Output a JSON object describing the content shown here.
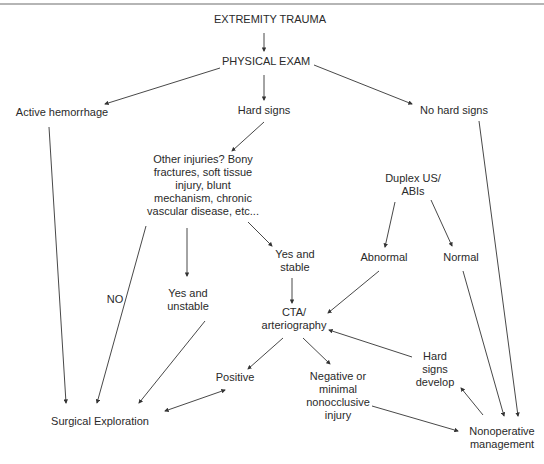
{
  "diagram": {
    "type": "flowchart",
    "nodes": {
      "extremity_trauma": "EXTREMITY TRAUMA",
      "physical_exam": "PHYSICAL EXAM",
      "active_hemorrhage": "Active hemorrhage",
      "hard_signs": "Hard signs",
      "no_hard_signs": "No hard signs",
      "other_injuries": [
        "Other injuries? Bony",
        "fractures, soft tissue",
        "injury, blunt",
        "mechanism, chronic",
        "vascular disease, etc..."
      ],
      "duplex": [
        "Duplex US/",
        "ABIs"
      ],
      "abnormal": "Abnormal",
      "normal": "Normal",
      "no": "NO",
      "yes_unstable": [
        "Yes and",
        "unstable"
      ],
      "yes_stable": [
        "Yes and",
        "stable"
      ],
      "cta": [
        "CTA/",
        "arteriography"
      ],
      "hard_signs_develop": [
        "Hard",
        "signs",
        "develop"
      ],
      "positive": "Positive",
      "negative": [
        "Negative or",
        "minimal",
        "nonocclusive",
        "injury"
      ],
      "surgical_exploration": "Surgical Exploration",
      "nonoperative": [
        "Nonoperative",
        "management"
      ]
    },
    "edges": [
      [
        "EXTREMITY TRAUMA",
        "PHYSICAL EXAM"
      ],
      [
        "PHYSICAL EXAM",
        "Active hemorrhage"
      ],
      [
        "PHYSICAL EXAM",
        "Hard signs"
      ],
      [
        "PHYSICAL EXAM",
        "No hard signs"
      ],
      [
        "Hard signs",
        "Other injuries"
      ],
      [
        "Active hemorrhage",
        "Surgical Exploration"
      ],
      [
        "Other injuries (NO)",
        "Surgical Exploration"
      ],
      [
        "Other injuries",
        "Yes and unstable"
      ],
      [
        "Other injuries",
        "Yes and stable"
      ],
      [
        "Yes and unstable",
        "Surgical Exploration"
      ],
      [
        "Yes and stable",
        "CTA/arteriography"
      ],
      [
        "Duplex US/ABIs",
        "Abnormal"
      ],
      [
        "Duplex US/ABIs",
        "Normal"
      ],
      [
        "Abnormal",
        "CTA/arteriography"
      ],
      [
        "Normal",
        "Nonoperative management"
      ],
      [
        "No hard signs",
        "Nonoperative management"
      ],
      [
        "CTA/arteriography",
        "Positive"
      ],
      [
        "CTA/arteriography",
        "Negative or minimal nonocclusive injury"
      ],
      [
        "Positive",
        "Surgical Exploration (bidirectional)"
      ],
      [
        "Negative or minimal nonocclusive injury",
        "Nonoperative management"
      ],
      [
        "Nonoperative management",
        "Hard signs develop"
      ],
      [
        "Hard signs develop",
        "CTA/arteriography"
      ]
    ]
  }
}
